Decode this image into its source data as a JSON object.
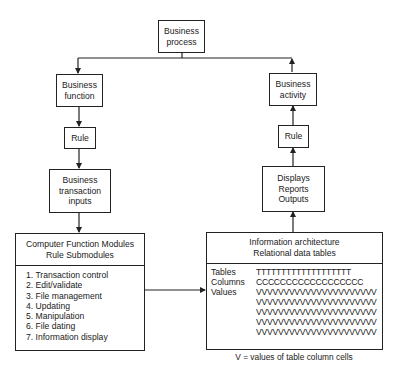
{
  "diagram": {
    "top": {
      "lines": [
        "Business",
        "process"
      ]
    },
    "left_branch": {
      "function": {
        "lines": [
          "Business",
          "function"
        ]
      },
      "rule": {
        "lines": [
          "Rule"
        ]
      },
      "inputs": {
        "lines": [
          "Business",
          "transaction",
          "inputs"
        ]
      },
      "modules": {
        "title_lines": [
          "Computer Function Modules",
          "Rule Submodules"
        ],
        "items": [
          "1. Transaction control",
          "2. Edit/validate",
          "3. File management",
          "4. Updating",
          "5. Manipulation",
          "6. File dating",
          "7. Information display"
        ]
      }
    },
    "right_branch": {
      "activity": {
        "lines": [
          "Business",
          "activity"
        ]
      },
      "rule": {
        "lines": [
          "Rule"
        ]
      },
      "outputs": {
        "lines": [
          "Displays",
          "Reports",
          "Outputs"
        ]
      },
      "info_arch": {
        "title_lines": [
          "Information architecture",
          "Relational data tables"
        ],
        "rows": [
          {
            "label": "Tables",
            "values": "TTTTTTTTTTTTTTTTTTT"
          },
          {
            "label": "Columns",
            "values": "CCCCCCCCCCCCCCCCCC"
          },
          {
            "label": "Values",
            "values": "VVVVVVVVVVVVVVVVVVVVVV"
          },
          {
            "label": "",
            "values": "VVVVVVVVVVVVVVVVVVVVVV"
          },
          {
            "label": "",
            "values": "VVVVVVVVVVVVVVVVVVVVVV"
          },
          {
            "label": "",
            "values": "VVVVVVVVVVVVVVVVVVVVVV"
          },
          {
            "label": "",
            "values": "VVVVVVVVVVVVVVVVVVVVVV"
          }
        ]
      },
      "caption": "V = values of table column cells"
    },
    "edges": [
      [
        "Business process",
        "Business function"
      ],
      [
        "Business function",
        "Rule (left)"
      ],
      [
        "Rule (left)",
        "Business transaction inputs"
      ],
      [
        "Business transaction inputs",
        "Computer Function Modules"
      ],
      [
        "Computer Function Modules",
        "Information architecture"
      ],
      [
        "Information architecture",
        "Displays Reports Outputs"
      ],
      [
        "Displays Reports Outputs",
        "Rule (right)"
      ],
      [
        "Rule (right)",
        "Business activity"
      ],
      [
        "Business activity",
        "Business process"
      ]
    ]
  }
}
